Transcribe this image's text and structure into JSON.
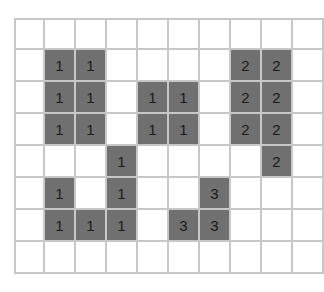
{
  "grid": {
    "rows": 8,
    "cols": 10,
    "fill_color": "#707070",
    "line_color": "#c8c8c8",
    "cells": [
      [
        null,
        null,
        null,
        null,
        null,
        null,
        null,
        null,
        null,
        null
      ],
      [
        null,
        "1",
        "1",
        null,
        null,
        null,
        null,
        "2",
        "2",
        null
      ],
      [
        null,
        "1",
        "1",
        null,
        "1",
        "1",
        null,
        "2",
        "2",
        null
      ],
      [
        null,
        "1",
        "1",
        null,
        "1",
        "1",
        null,
        "2",
        "2",
        null
      ],
      [
        null,
        null,
        null,
        "1",
        null,
        null,
        null,
        null,
        "2",
        null
      ],
      [
        null,
        "1",
        null,
        "1",
        null,
        null,
        "3",
        null,
        null,
        null
      ],
      [
        null,
        "1",
        "1",
        "1",
        null,
        "3",
        "3",
        null,
        null,
        null
      ],
      [
        null,
        null,
        null,
        null,
        null,
        null,
        null,
        null,
        null,
        null
      ]
    ]
  }
}
